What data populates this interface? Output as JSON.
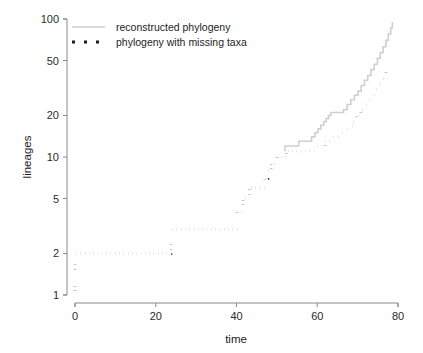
{
  "chart_data": {
    "type": "line",
    "title": "",
    "subtitle": "",
    "xlabel": "time",
    "ylabel": "lineages",
    "xlim": [
      0,
      80
    ],
    "ylim": [
      1,
      100
    ],
    "yscale": "log",
    "xscale": "linear",
    "grid": false,
    "legend_position": "top-left",
    "xticks": [
      0,
      20,
      40,
      60,
      80
    ],
    "xtick_labels": [
      "0",
      "20",
      "40",
      "60",
      "80"
    ],
    "yticks": [
      1,
      2,
      5,
      10,
      20,
      50,
      100
    ],
    "ytick_labels": [
      "1",
      "2",
      "5",
      "10",
      "20",
      "50",
      "100"
    ],
    "series": [
      {
        "name": "reconstructed phylogeny",
        "style": "solid",
        "color": "#cfcfcf",
        "points": [
          [
            52.0,
            11
          ],
          [
            52.0,
            12
          ],
          [
            55.4,
            12
          ],
          [
            55.4,
            13
          ],
          [
            58.6,
            13
          ],
          [
            58.6,
            14
          ],
          [
            59.4,
            14
          ],
          [
            59.4,
            15
          ],
          [
            60.2,
            15
          ],
          [
            60.2,
            16
          ],
          [
            60.9,
            16
          ],
          [
            60.9,
            17
          ],
          [
            61.6,
            17
          ],
          [
            61.6,
            18
          ],
          [
            62.2,
            18
          ],
          [
            62.2,
            19
          ],
          [
            62.8,
            19
          ],
          [
            62.8,
            20
          ],
          [
            63.4,
            20
          ],
          [
            63.4,
            21
          ],
          [
            66.5,
            21
          ],
          [
            66.5,
            22
          ],
          [
            67.4,
            22
          ],
          [
            67.4,
            24
          ],
          [
            68.3,
            24
          ],
          [
            68.3,
            26
          ],
          [
            69.2,
            26
          ],
          [
            69.2,
            28
          ],
          [
            70.1,
            28
          ],
          [
            70.1,
            30
          ],
          [
            70.9,
            30
          ],
          [
            70.9,
            33
          ],
          [
            71.7,
            33
          ],
          [
            71.7,
            36
          ],
          [
            72.5,
            36
          ],
          [
            72.5,
            39
          ],
          [
            73.3,
            39
          ],
          [
            73.3,
            43
          ],
          [
            74.1,
            43
          ],
          [
            74.1,
            47
          ],
          [
            74.9,
            47
          ],
          [
            74.9,
            52
          ],
          [
            75.6,
            52
          ],
          [
            75.6,
            57
          ],
          [
            76.3,
            57
          ],
          [
            76.3,
            63
          ],
          [
            77.0,
            63
          ],
          [
            77.0,
            70
          ],
          [
            77.6,
            70
          ],
          [
            77.6,
            78
          ],
          [
            78.2,
            78
          ],
          [
            78.2,
            86
          ],
          [
            78.6,
            86
          ],
          [
            78.6,
            95
          ]
        ]
      },
      {
        "name": "phylogeny with missing taxa",
        "style": "dotted",
        "color": "#1a1a1a",
        "points": [
          [
            0.0,
            1
          ],
          [
            0.0,
            2
          ],
          [
            23.8,
            2
          ],
          [
            23.8,
            3
          ],
          [
            40.2,
            3
          ],
          [
            40.2,
            4
          ],
          [
            41.6,
            4
          ],
          [
            41.6,
            5
          ],
          [
            43.2,
            5
          ],
          [
            43.2,
            6
          ],
          [
            47.0,
            6
          ],
          [
            47.0,
            7
          ],
          [
            47.8,
            7
          ],
          [
            47.8,
            8
          ],
          [
            48.6,
            8
          ],
          [
            48.6,
            9
          ],
          [
            50.0,
            9
          ],
          [
            50.0,
            10
          ],
          [
            52.4,
            10
          ],
          [
            52.4,
            11
          ],
          [
            59.5,
            11
          ],
          [
            59.5,
            12
          ],
          [
            62.0,
            12
          ],
          [
            62.0,
            13
          ],
          [
            63.8,
            13
          ],
          [
            63.8,
            14
          ],
          [
            65.4,
            14
          ],
          [
            65.4,
            15
          ],
          [
            66.6,
            15
          ],
          [
            66.6,
            16
          ],
          [
            67.8,
            16
          ],
          [
            67.8,
            17
          ],
          [
            68.8,
            17
          ],
          [
            68.8,
            18
          ],
          [
            69.8,
            18
          ],
          [
            69.8,
            20
          ],
          [
            70.8,
            20
          ],
          [
            70.8,
            22
          ],
          [
            71.8,
            22
          ],
          [
            71.8,
            24
          ],
          [
            72.8,
            24
          ],
          [
            72.8,
            26
          ],
          [
            73.7,
            26
          ],
          [
            73.7,
            28
          ],
          [
            74.6,
            28
          ],
          [
            74.6,
            31
          ],
          [
            75.4,
            31
          ],
          [
            75.4,
            34
          ],
          [
            76.2,
            34
          ],
          [
            76.2,
            37
          ],
          [
            77.0,
            37
          ],
          [
            77.0,
            41
          ],
          [
            77.8,
            41
          ],
          [
            77.8,
            46
          ]
        ]
      }
    ],
    "legend": [
      {
        "label": "reconstructed phylogeny",
        "marker": "line",
        "color": "#cfcfcf"
      },
      {
        "label": "phylogeny with missing taxa",
        "marker": "dots",
        "color": "#1a1a1a"
      }
    ]
  }
}
